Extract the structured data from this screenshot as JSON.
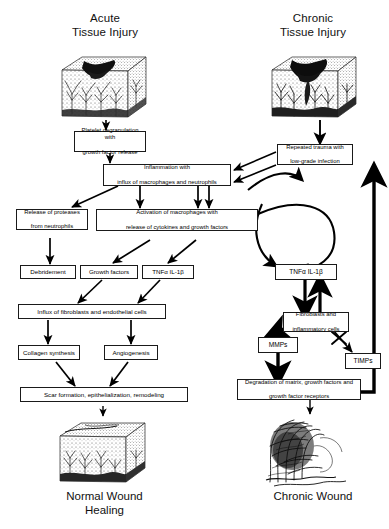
{
  "figure": {
    "type": "flowchart",
    "title_left": "Acute\nTissue Injury",
    "title_right": "Chronic\nTissue Injury"
  },
  "headers": {
    "left_line1": "Acute",
    "left_line2": "Tissue Injury",
    "right_line1": "Chronic",
    "right_line2": "Tissue Injury"
  },
  "footers": {
    "left_line1": "Normal Wound",
    "left_line2": "Healing",
    "right_line1": "Chronic Wound",
    "right_line2": ""
  },
  "boxes": {
    "platelet": {
      "line1": "Platelet degranulation with",
      "line2": "growth factor release"
    },
    "inflammation": {
      "line1": "Inflammation with",
      "line2": "influx of macrophages and neutrophils"
    },
    "repeated_trauma": {
      "line1": "Repeated trauma with",
      "line2": "low-grade infection"
    },
    "proteases": {
      "line1": "Release of proteases",
      "line2": "from neutrophils"
    },
    "activation": {
      "line1": "Activation of macrophages with",
      "line2": "release of cytokines and growth factors"
    },
    "debridement": {
      "line1": "Debridement"
    },
    "growth_factors": {
      "line1": "Growth factors"
    },
    "tnf_left": {
      "line1": "TNFα IL-1β"
    },
    "tnf_right": {
      "line1": "TNFα IL-1β"
    },
    "influx": {
      "line1": "Influx of fibroblasts and endothelial cells"
    },
    "fibroblasts": {
      "line1": "Fibroblasts and",
      "line2": "inflammatory cells"
    },
    "collagen": {
      "line1": "Collagen synthesis"
    },
    "angiogenesis": {
      "line1": "Angiogenesis"
    },
    "mmps": {
      "line1": "MMPs"
    },
    "timps": {
      "line1": "TIMPs"
    },
    "scar": {
      "line1": "Scar formation, epithelialization, remodeling"
    },
    "degradation": {
      "line1": "Degradation of matrix, growth factors and",
      "line2": "growth factor receptors"
    }
  },
  "icons": {
    "tissue_acute": "acute-tissue-block-illustration",
    "tissue_chronic": "chronic-tissue-block-illustration",
    "wound_normal": "normal-wound-block-illustration",
    "wound_chronic": "chronic-wound-illustration",
    "inhibition": "blocked-arrow-x-icon",
    "feedback_loop": "vicious-cycle-loop-icon"
  },
  "colors": {
    "ink": "#000000",
    "box_border": "#1a1a1a",
    "background": "#ffffff"
  }
}
